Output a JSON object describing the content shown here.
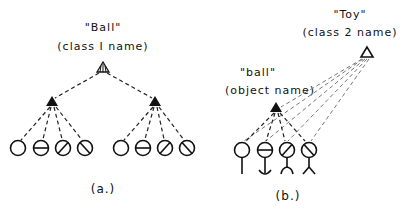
{
  "panel_a": {
    "class_name": "\"Ball\"",
    "class_caption": "(class I name)",
    "caption": "(a.)",
    "groups": 2,
    "feature_symbols": [
      "empty-circle",
      "horizontal-bar-circle",
      "forward-slash-circle",
      "back-slash-circle"
    ]
  },
  "panel_b": {
    "class_name": "\"Toy\"",
    "class_caption": "(class 2 name)",
    "object_name": "\"ball\"",
    "object_caption": "(object name)",
    "caption": "(b.)",
    "feature_symbols": [
      "empty-circle-stem",
      "horizontal-bar-circle-anchor",
      "forward-slash-circle-legs",
      "back-slash-circle-legs"
    ]
  }
}
